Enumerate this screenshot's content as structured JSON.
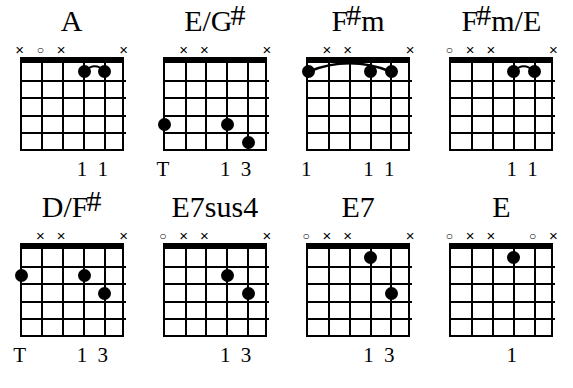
{
  "sheet": {
    "title": "Guitar chord diagrams",
    "string_count": 6,
    "fret_count": 5,
    "colors": {
      "ink": "#000000",
      "paper": "#ffffff"
    }
  },
  "legend": {
    "open_symbol": "o",
    "muted_symbol": "x",
    "thumb_label": "T"
  },
  "chords": [
    {
      "name": "A",
      "name_base": "A",
      "name_sharp": "",
      "markers": [
        "x",
        "o",
        "x",
        "",
        "",
        "x"
      ],
      "dots": [
        {
          "string": 4,
          "fret": 1
        },
        {
          "string": 5,
          "fret": 1
        }
      ],
      "barre": {
        "from_string": 4,
        "to_string": 5,
        "fret": 1,
        "style": "small-arc"
      },
      "fingers": [
        {
          "string": 4,
          "label": "1"
        },
        {
          "string": 5,
          "label": "1"
        }
      ]
    },
    {
      "name": "E/G#",
      "name_base": "E/G",
      "name_sharp": "#",
      "markers": [
        "",
        "x",
        "x",
        "",
        "",
        "x"
      ],
      "dots": [
        {
          "string": 1,
          "fret": 4
        },
        {
          "string": 4,
          "fret": 4
        },
        {
          "string": 5,
          "fret": 5
        }
      ],
      "barre": null,
      "fingers": [
        {
          "string": 1,
          "label": "T"
        },
        {
          "string": 4,
          "label": "1"
        },
        {
          "string": 5,
          "label": "3"
        }
      ]
    },
    {
      "name": "F#m",
      "name_base": "F",
      "name_sharp": "#",
      "name_tail": "m",
      "markers": [
        "",
        "x",
        "x",
        "",
        "",
        "x"
      ],
      "dots": [
        {
          "string": 1,
          "fret": 1
        },
        {
          "string": 4,
          "fret": 1
        },
        {
          "string": 5,
          "fret": 1
        }
      ],
      "barre": {
        "from_string": 1,
        "to_string": 5,
        "fret": 1,
        "style": "wide-arc"
      },
      "fingers": [
        {
          "string": 1,
          "label": "1"
        },
        {
          "string": 4,
          "label": "1"
        },
        {
          "string": 5,
          "label": "1"
        }
      ]
    },
    {
      "name": "F#m/E",
      "name_base": "F",
      "name_sharp": "#",
      "name_tail": "m/E",
      "markers": [
        "o",
        "x",
        "x",
        "",
        "",
        "x"
      ],
      "dots": [
        {
          "string": 4,
          "fret": 1
        },
        {
          "string": 5,
          "fret": 1
        }
      ],
      "barre": {
        "from_string": 4,
        "to_string": 5,
        "fret": 1,
        "style": "small-arc"
      },
      "fingers": [
        {
          "string": 4,
          "label": "1"
        },
        {
          "string": 5,
          "label": "1"
        }
      ]
    },
    {
      "name": "D/F#",
      "name_base": "D/F",
      "name_sharp": "#",
      "markers": [
        "",
        "x",
        "x",
        "",
        "",
        "x"
      ],
      "dots": [
        {
          "string": 1,
          "fret": 2
        },
        {
          "string": 4,
          "fret": 2
        },
        {
          "string": 5,
          "fret": 3
        }
      ],
      "barre": null,
      "fingers": [
        {
          "string": 1,
          "label": "T"
        },
        {
          "string": 4,
          "label": "1"
        },
        {
          "string": 5,
          "label": "3"
        }
      ]
    },
    {
      "name": "E7sus4",
      "name_base": "E7sus4",
      "name_sharp": "",
      "markers": [
        "o",
        "x",
        "x",
        "",
        "",
        "x"
      ],
      "dots": [
        {
          "string": 4,
          "fret": 2
        },
        {
          "string": 5,
          "fret": 3
        }
      ],
      "barre": null,
      "fingers": [
        {
          "string": 4,
          "label": "1"
        },
        {
          "string": 5,
          "label": "3"
        }
      ]
    },
    {
      "name": "E7",
      "name_base": "E7",
      "name_sharp": "",
      "markers": [
        "o",
        "x",
        "x",
        "",
        "",
        "x"
      ],
      "dots": [
        {
          "string": 4,
          "fret": 1
        },
        {
          "string": 5,
          "fret": 3
        }
      ],
      "barre": null,
      "fingers": [
        {
          "string": 4,
          "label": "1"
        },
        {
          "string": 5,
          "label": "3"
        }
      ]
    },
    {
      "name": "E",
      "name_base": "E",
      "name_sharp": "",
      "markers": [
        "o",
        "x",
        "x",
        "",
        "o",
        "x"
      ],
      "dots": [
        {
          "string": 4,
          "fret": 1
        }
      ],
      "barre": null,
      "fingers": [
        {
          "string": 4,
          "label": "1"
        }
      ]
    }
  ]
}
